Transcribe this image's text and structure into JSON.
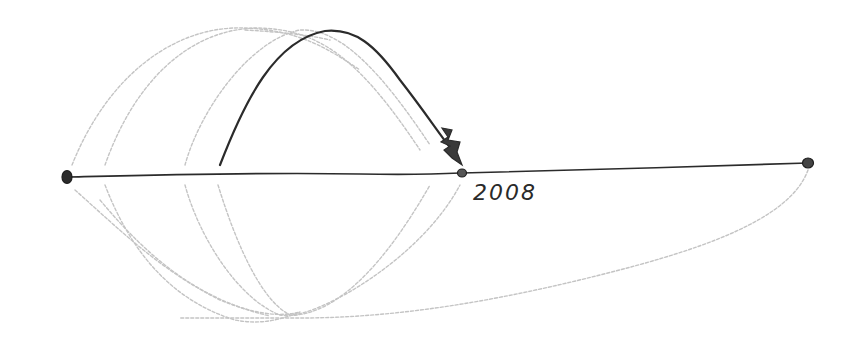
{
  "diagram": {
    "type": "timeline-sketch",
    "style": "hand-drawn pencil",
    "colors": {
      "ink": "#2b2b2b",
      "faint": "#bdbdbd",
      "background": "#ffffff"
    },
    "timeline": {
      "points": [
        {
          "id": "start",
          "x": 67,
          "y": 177
        },
        {
          "id": "marker-2008",
          "x": 462,
          "y": 173,
          "label": "2008"
        },
        {
          "id": "end",
          "x": 808,
          "y": 163
        }
      ]
    },
    "labels": {
      "year": "2008"
    },
    "arcs": {
      "highlighted": {
        "from": [
          220,
          165
        ],
        "peak": [
          325,
          30
        ],
        "to": [
          455,
          160
        ],
        "arrowhead": true
      },
      "faint_upper_count": 3,
      "faint_lower_count": 5
    }
  }
}
